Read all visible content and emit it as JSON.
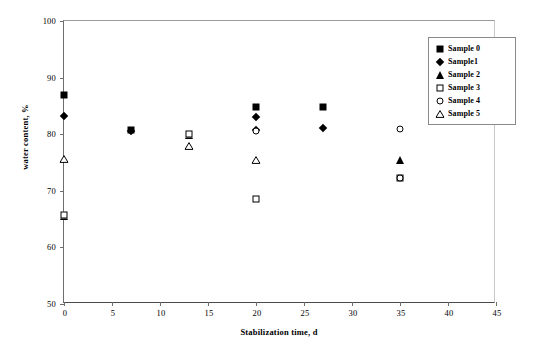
{
  "chart_data": {
    "type": "scatter",
    "title": "",
    "xlabel": "Stabilization time, d",
    "ylabel": "water content, %",
    "xlim": [
      0,
      45
    ],
    "ylim": [
      50,
      100
    ],
    "xticks": [
      0,
      5,
      10,
      15,
      20,
      25,
      30,
      35,
      40,
      45
    ],
    "yticks": [
      50,
      60,
      70,
      80,
      90,
      100
    ],
    "grid": false,
    "legend_position": "top-right",
    "series": [
      {
        "name": "Sample 0",
        "marker": "filled-square",
        "points": [
          {
            "x": 0,
            "y": 87.0
          },
          {
            "x": 7,
            "y": 80.8
          },
          {
            "x": 20,
            "y": 84.8
          },
          {
            "x": 27,
            "y": 84.8
          }
        ]
      },
      {
        "name": "Sample1",
        "marker": "filled-diamond",
        "points": [
          {
            "x": 0,
            "y": 83.3
          },
          {
            "x": 7,
            "y": 80.6
          },
          {
            "x": 20,
            "y": 83.0
          },
          {
            "x": 20,
            "y": 80.8
          },
          {
            "x": 27,
            "y": 81.1
          }
        ]
      },
      {
        "name": "Sample 2",
        "marker": "filled-triangle",
        "points": [
          {
            "x": 0,
            "y": 65.6
          },
          {
            "x": 13,
            "y": 79.9
          },
          {
            "x": 35,
            "y": 75.5
          }
        ]
      },
      {
        "name": "Sample 3",
        "marker": "open-square",
        "points": [
          {
            "x": 0,
            "y": 65.8
          },
          {
            "x": 13,
            "y": 80.0
          },
          {
            "x": 20,
            "y": 68.5
          },
          {
            "x": 35,
            "y": 72.3
          }
        ]
      },
      {
        "name": "Sample 4",
        "marker": "open-circle",
        "points": [
          {
            "x": 20,
            "y": 80.5
          },
          {
            "x": 35,
            "y": 81.0
          },
          {
            "x": 35,
            "y": 72.3
          }
        ]
      },
      {
        "name": "Sample 5",
        "marker": "open-triangle",
        "points": [
          {
            "x": 0,
            "y": 75.7
          },
          {
            "x": 13,
            "y": 78.0
          },
          {
            "x": 20,
            "y": 75.4
          }
        ]
      }
    ]
  },
  "legend": {
    "entries": [
      {
        "label": "Sample 0",
        "marker": "filled-square"
      },
      {
        "label": "Sample1",
        "marker": "filled-diamond"
      },
      {
        "label": "Sample 2",
        "marker": "filled-triangle"
      },
      {
        "label": "Sample 3",
        "marker": "open-square"
      },
      {
        "label": "Sample 4",
        "marker": "open-circle"
      },
      {
        "label": "Sample 5",
        "marker": "open-triangle"
      }
    ]
  },
  "colors": {
    "marker": "#000000",
    "axis": "#6e6e6e",
    "background": "#ffffff"
  }
}
